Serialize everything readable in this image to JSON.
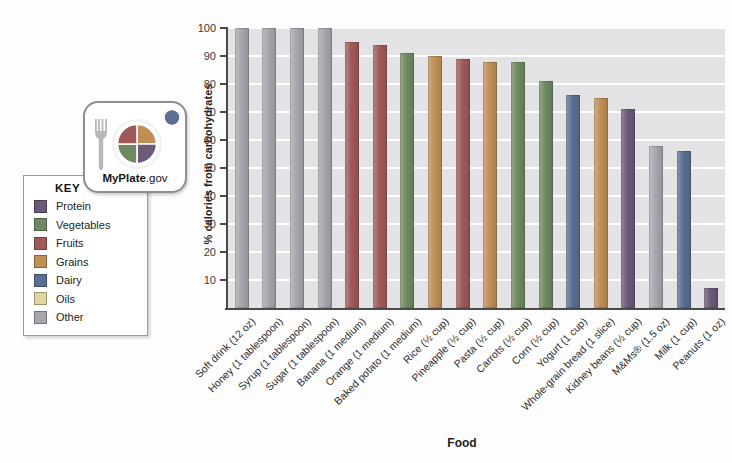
{
  "palette": {
    "Protein": "#6b5a78",
    "Vegetables": "#6f8a62",
    "Fruits": "#9e5a58",
    "Grains": "#c08f55",
    "Dairy": "#5b6f94",
    "Oils": "#e0d79e",
    "Other": "#a6a6ae"
  },
  "myplate": {
    "brand": "MyPlate",
    "suffix": ".gov"
  },
  "key": {
    "title": "KEY",
    "items": [
      "Protein",
      "Vegetables",
      "Fruits",
      "Grains",
      "Dairy",
      "Oils",
      "Other"
    ]
  },
  "chart_data": {
    "type": "bar",
    "title": "",
    "xlabel": "Food",
    "ylabel": "% calories from carbohydrates",
    "ylim": [
      0,
      100
    ],
    "yticks": [
      10,
      20,
      30,
      40,
      50,
      60,
      70,
      80,
      90,
      100
    ],
    "grid": true,
    "legend_position": "left",
    "plot_background": "#e3e3e6",
    "gridline_color": "#ffffff",
    "axis_color": "#4a4a4a",
    "categories": [
      "Soft drink (12 oz)",
      "Honey (1 tablespoon)",
      "Syrup (1 tablespoon)",
      "Sugar (1 tablespoon)",
      "Banana (1 medium)",
      "Orange (1 medium)",
      "Baked potato (1 medium)",
      "Rice (½ cup)",
      "Pineapple (½ cup)",
      "Pasta (½ cup)",
      "Carrots (½ cup)",
      "Corn (½ cup)",
      "Yogurt (1 cup)",
      "Whole-grain bread (1 slice)",
      "Kidney beans (½ cup)",
      "M&Ms® (1.5 oz)",
      "Milk (1 cup)",
      "Peanuts (1 oz)"
    ],
    "values": [
      100,
      100,
      100,
      100,
      95,
      94,
      91,
      90,
      89,
      88,
      88,
      81,
      76,
      75,
      71,
      58,
      56,
      7
    ],
    "food_groups": [
      "Other",
      "Other",
      "Other",
      "Other",
      "Fruits",
      "Fruits",
      "Vegetables",
      "Grains",
      "Fruits",
      "Grains",
      "Vegetables",
      "Vegetables",
      "Dairy",
      "Grains",
      "Protein",
      "Other",
      "Dairy",
      "Protein"
    ]
  }
}
